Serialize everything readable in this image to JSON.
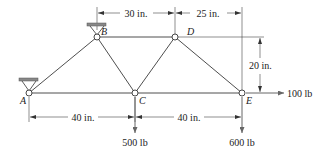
{
  "diagram": {
    "type": "truss",
    "nodes": [
      {
        "id": "A",
        "label": "A",
        "x": 29,
        "y": 93,
        "support": "pin"
      },
      {
        "id": "B",
        "label": "B",
        "x": 97,
        "y": 37,
        "support": "pin"
      },
      {
        "id": "C",
        "label": "C",
        "x": 135,
        "y": 93
      },
      {
        "id": "D",
        "label": "D",
        "x": 175,
        "y": 37
      },
      {
        "id": "E",
        "label": "E",
        "x": 242,
        "y": 93
      }
    ],
    "members": [
      "AB",
      "AC",
      "BC",
      "BD",
      "CD",
      "CE",
      "DE"
    ],
    "dimensions": {
      "top_left": "30 in.",
      "top_right": "25 in.",
      "height": "20 in.",
      "bottom_left": "40 in.",
      "bottom_right": "40 in."
    },
    "loads": {
      "at_C": "500 lb",
      "at_E_vertical": "600 lb",
      "at_E_horizontal": "100 lb"
    }
  }
}
